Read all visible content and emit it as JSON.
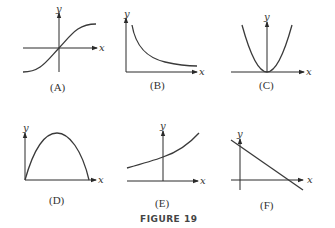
{
  "figure": {
    "caption": "FIGURE 19",
    "panels": [
      {
        "id": "A",
        "label": "(A)",
        "x_axis": "x",
        "y_axis": "y",
        "shape": "sigmoid increasing through origin"
      },
      {
        "id": "B",
        "label": "(B)",
        "x_axis": "x",
        "y_axis": "y",
        "shape": "decreasing decay curve (like 1/x)"
      },
      {
        "id": "C",
        "label": "(C)",
        "x_axis": "x",
        "y_axis": "y",
        "shape": "upward parabola with vertex at origin"
      },
      {
        "id": "D",
        "label": "(D)",
        "x_axis": "x",
        "y_axis": "y",
        "shape": "downward arch starting at origin"
      },
      {
        "id": "E",
        "label": "(E)",
        "x_axis": "x",
        "y_axis": "y",
        "shape": "increasing exponential curve"
      },
      {
        "id": "F",
        "label": "(F)",
        "x_axis": "x",
        "y_axis": "y",
        "shape": "decreasing straight line"
      }
    ]
  }
}
